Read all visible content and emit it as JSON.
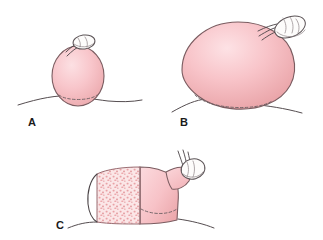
{
  "figure": {
    "background_color": "#ffffff",
    "panel_count": 3,
    "style": "hand-drawn medical line illustration with watercolor wash"
  },
  "palette": {
    "mass_fill_light": "#fbdcdf",
    "mass_fill_core": "#f7bfc4",
    "mass_fill_shadow": "#e8a0a4",
    "cut_face_base": "#fae4e5",
    "stipple_dot": "#e9a2a6",
    "outline_stroke": "#4a4346",
    "mass_outline": "#7a5c60",
    "cap_fill": "#fdfcfb",
    "cap_stroke": "#5a5255",
    "label_color": "#1a1a1a",
    "dashed_stroke": "#6b5f62"
  },
  "panels": [
    {
      "id": "A",
      "label": "A",
      "label_position": {
        "x": 28,
        "y": 126
      },
      "description": "Small rounded sessile mass arising from a gently curved tissue surface, with a small pale cap structure attached at its apex",
      "mass": {
        "shape": "ovoid",
        "center_x": 78,
        "center_y": 76,
        "radius_x": 26,
        "radius_y": 30,
        "relative_size": "small"
      },
      "cap": {
        "present": true,
        "shape": "small-oval",
        "center_x": 84,
        "center_y": 42,
        "radius_x": 11,
        "radius_y": 7,
        "rotation_deg": -8
      },
      "stalk_threads": 2,
      "base": {
        "dashed_arc": true,
        "baseline_present": true
      },
      "cut_surface": false
    },
    {
      "id": "B",
      "label": "B",
      "label_position": {
        "x": 180,
        "y": 126
      },
      "description": "Markedly enlarged ovoid mass, tilted obliquely, broad base on the tissue surface, pale cap structure displaced to the upper right pole",
      "mass": {
        "shape": "tilted-ovoid",
        "center_x": 236,
        "center_y": 66,
        "radius_x": 57,
        "radius_y": 45,
        "rotation_deg": -20,
        "relative_size": "large"
      },
      "cap": {
        "present": true,
        "shape": "oval",
        "center_x": 290,
        "center_y": 27,
        "radius_x": 16,
        "radius_y": 10,
        "rotation_deg": -22
      },
      "stalk_threads": 3,
      "base": {
        "dashed_arc": true,
        "baseline_present": true
      },
      "cut_surface": false
    },
    {
      "id": "C",
      "label": "C",
      "label_position": {
        "x": 56,
        "y": 229
      },
      "description": "Sectioned specimen shown as a flattened dome; the left two-thirds displays a finely stippled granular cut surface, the right portion is a smooth pink capsule tapering to a pale cap at the upper right",
      "mass": {
        "shape": "flattened-dome",
        "center_x": 152,
        "center_y": 198,
        "width": 110,
        "height": 64,
        "relative_size": "sectioned"
      },
      "cap": {
        "present": true,
        "shape": "oval",
        "center_x": 192,
        "center_y": 168,
        "radius_x": 12,
        "radius_y": 10,
        "rotation_deg": -15
      },
      "stalk_threads": 3,
      "base": {
        "dashed_arc": true,
        "baseline_present": true
      },
      "cut_surface": true,
      "cut_surface_texture": {
        "type": "stipple",
        "description": "fine pink granular speckling",
        "dot_count": 150,
        "dot_color": "#e9a2a6"
      }
    }
  ]
}
